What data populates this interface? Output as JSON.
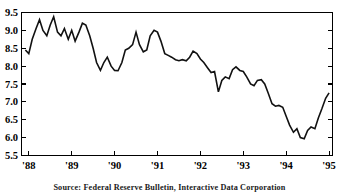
{
  "chart_data": {
    "type": "line",
    "title": "",
    "subtitle": "",
    "xlabel": "",
    "ylabel": "",
    "xlim": [
      1987.83,
      1995.08
    ],
    "ylim": [
      5.5,
      9.5
    ],
    "grid": false,
    "legend": "none",
    "line_color": "#111111",
    "background_color": "#ffffff",
    "ytick_labels": [
      "9.5",
      "9.0",
      "8.5",
      "8.0",
      "7.5",
      "7.0",
      "6.5",
      "6.0",
      "5.5"
    ],
    "ytick_values": [
      9.5,
      9.0,
      8.5,
      8.0,
      7.5,
      7.0,
      6.5,
      6.0,
      5.5
    ],
    "xtick_labels": [
      "'88",
      "'89",
      "'90",
      "'91",
      "'92",
      "'93",
      "'94",
      "'95"
    ],
    "xtick_values": [
      1988,
      1989,
      1990,
      1991,
      1992,
      1993,
      1994,
      1995
    ],
    "x": [
      1987.92,
      1988.0,
      1988.08,
      1988.17,
      1988.25,
      1988.33,
      1988.42,
      1988.5,
      1988.58,
      1988.67,
      1988.75,
      1988.83,
      1988.92,
      1989.0,
      1989.08,
      1989.17,
      1989.25,
      1989.33,
      1989.42,
      1989.5,
      1989.58,
      1989.67,
      1989.75,
      1989.83,
      1989.92,
      1990.0,
      1990.08,
      1990.17,
      1990.25,
      1990.33,
      1990.42,
      1990.5,
      1990.58,
      1990.67,
      1990.75,
      1990.83,
      1990.92,
      1991.0,
      1991.08,
      1991.17,
      1991.25,
      1991.33,
      1991.42,
      1991.5,
      1991.58,
      1991.67,
      1991.75,
      1991.83,
      1991.92,
      1992.0,
      1992.08,
      1992.17,
      1992.25,
      1992.33,
      1992.42,
      1992.5,
      1992.58,
      1992.67,
      1992.75,
      1992.83,
      1992.92,
      1993.0,
      1993.08,
      1993.17,
      1993.25,
      1993.33,
      1993.42,
      1993.5,
      1993.58,
      1993.67,
      1993.75,
      1993.83,
      1993.92,
      1994.0,
      1994.08,
      1994.17,
      1994.25,
      1994.33,
      1994.42,
      1994.5,
      1994.58,
      1994.67,
      1994.75,
      1994.83,
      1994.92,
      1995.0
    ],
    "values": [
      8.45,
      8.35,
      8.75,
      9.05,
      9.3,
      9.0,
      8.85,
      9.15,
      9.38,
      8.95,
      8.85,
      9.05,
      8.75,
      9.0,
      8.7,
      8.95,
      9.2,
      9.15,
      8.85,
      8.5,
      8.1,
      7.88,
      8.1,
      8.25,
      8.0,
      7.88,
      7.87,
      8.1,
      8.45,
      8.5,
      8.6,
      8.95,
      8.6,
      8.4,
      8.45,
      8.85,
      9.0,
      8.95,
      8.7,
      8.35,
      8.3,
      8.25,
      8.18,
      8.15,
      8.18,
      8.15,
      8.25,
      8.42,
      8.35,
      8.2,
      8.1,
      7.95,
      7.82,
      7.85,
      7.28,
      7.6,
      7.7,
      7.65,
      7.9,
      7.98,
      7.88,
      7.85,
      7.7,
      7.5,
      7.45,
      7.6,
      7.62,
      7.5,
      7.25,
      6.95,
      6.88,
      6.9,
      6.85,
      6.6,
      6.35,
      6.15,
      6.25,
      6.0,
      5.97,
      6.2,
      6.3,
      6.25,
      6.55,
      6.8,
      7.1,
      7.25
    ],
    "series_description": "Monthly interest rate, percent"
  },
  "source_note": "Source: Federal Reserve Bulletin, Interactive Data Corporation"
}
